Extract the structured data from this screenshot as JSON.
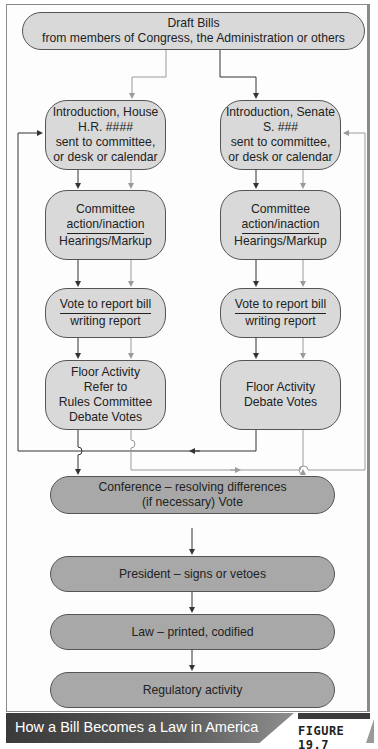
{
  "figure": {
    "caption": "How a Bill Becomes a Law in America",
    "label": "FIGURE 19.7"
  },
  "nodes": {
    "draft": {
      "line1": "Draft Bills",
      "line2": "from members of Congress, the Administration or others"
    },
    "house_intro": {
      "line1": "Introduction, House",
      "line2": "H.R. ####",
      "line3": "sent to committee,",
      "line4": "or desk or calendar"
    },
    "senate_intro": {
      "line1": "Introduction, Senate",
      "line2": "S. ###",
      "line3": "sent to committee,",
      "line4": "or desk or calendar"
    },
    "house_committee": {
      "line1": "Committee",
      "line2": "action/inaction",
      "line3": "Hearings/Markup"
    },
    "senate_committee": {
      "line1": "Committee",
      "line2": "action/inaction",
      "line3": "Hearings/Markup"
    },
    "house_vote": {
      "line1": "Vote to report bill",
      "line2": "writing report"
    },
    "senate_vote": {
      "line1": "Vote to report bill",
      "line2": "writing report"
    },
    "house_floor": {
      "line1": "Floor Activity",
      "line2": "Refer to",
      "line3": "Rules Committee",
      "line4": "Debate Votes"
    },
    "senate_floor": {
      "line1": "Floor Activity",
      "line2": "Debate Votes"
    },
    "conference": {
      "line1": "Conference – resolving differences",
      "line2": "(if necessary) Vote"
    },
    "president": {
      "line1": "President – signs or vetoes"
    },
    "law": {
      "line1": "Law – printed, codified"
    },
    "regulatory": {
      "line1": "Regulatory activity"
    }
  },
  "colors": {
    "node_light": "#d9d9d9",
    "node_dark": "#a8a8a8",
    "arrow_dark": "#333333",
    "arrow_light": "#9a9a9a"
  }
}
